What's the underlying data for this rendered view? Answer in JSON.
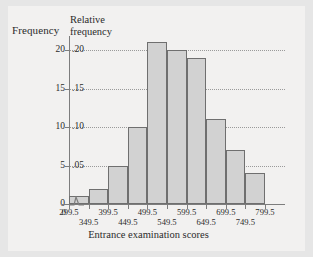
{
  "figure": {
    "background_color": "#e6e6e6",
    "plate_color": "#f2f1f0"
  },
  "chart_data": {
    "type": "bar",
    "title": "",
    "xlabel": "Entrance examination scores",
    "ylabel": "Frequency",
    "ylabel_secondary": "Relative frequency",
    "grid": true,
    "legend": "none",
    "bar_fill_color": "#d2d2d2",
    "bar_edge_color": "#6f6f6f",
    "axis_color": "#7d7d7d",
    "ylim": [
      0,
      21.8
    ],
    "xlim_labels": [
      "0",
      "299.5",
      "799.5"
    ],
    "bin_width": 50,
    "bin_edges": [
      299.5,
      349.5,
      399.5,
      449.5,
      499.5,
      549.5,
      599.5,
      649.5,
      699.5,
      749.5,
      799.5
    ],
    "categories": [
      "299.5-349.5",
      "349.5-399.5",
      "399.5-449.5",
      "449.5-499.5",
      "499.5-549.5",
      "549.5-599.5",
      "599.5-649.5",
      "649.5-699.5",
      "699.5-749.5",
      "749.5-799.5"
    ],
    "values": [
      1,
      2,
      5,
      10,
      21,
      20,
      19,
      11,
      7,
      4
    ],
    "relative_values": [
      0.01,
      0.02,
      0.05,
      0.1,
      0.21,
      0.2,
      0.19,
      0.11,
      0.07,
      0.04
    ],
    "y_ticks_frequency": [
      "0",
      "5",
      "10",
      "15",
      "20"
    ],
    "y_ticks_frequency_values": [
      0,
      5,
      10,
      15,
      20
    ],
    "y_ticks_relative": [
      ".05",
      ".10",
      ".15",
      ".20"
    ],
    "y_ticks_relative_values": [
      5,
      10,
      15,
      20
    ],
    "x_ticks_row1": [
      "0",
      "299.5",
      "399.5",
      "499.5",
      "599.5",
      "699.5",
      "799.5"
    ],
    "x_ticks_row2": [
      "349.5",
      "449.5",
      "549.5",
      "649.5",
      "749.5"
    ],
    "axis_break": true
  },
  "axes": {
    "frequency_title": "Frequency",
    "relative_frequency_title_line1": "Relative",
    "relative_frequency_title_line2": "frequency",
    "x_axis_title": "Entrance examination scores"
  },
  "y_labels_left": [
    {
      "text": "20",
      "value": 20
    },
    {
      "text": "15",
      "value": 15
    },
    {
      "text": "10",
      "value": 10
    },
    {
      "text": "5",
      "value": 5
    },
    {
      "text": "0",
      "value": 0
    }
  ],
  "y_labels_right": [
    {
      "text": ".20",
      "value": 20
    },
    {
      "text": ".15",
      "value": 15
    },
    {
      "text": ".10",
      "value": 10
    },
    {
      "text": ".05",
      "value": 5
    }
  ],
  "x_labels_row1": [
    {
      "text": "0",
      "pos": 0
    },
    {
      "text": "299.5",
      "pos": 1
    },
    {
      "text": "399.5",
      "pos": 3
    },
    {
      "text": "499.5",
      "pos": 5
    },
    {
      "text": "599.5",
      "pos": 7
    },
    {
      "text": "699.5",
      "pos": 9
    },
    {
      "text": "799.5",
      "pos": 11
    }
  ],
  "x_labels_row2": [
    {
      "text": "349.5",
      "pos": 2
    },
    {
      "text": "449.5",
      "pos": 4
    },
    {
      "text": "549.5",
      "pos": 6
    },
    {
      "text": "649.5",
      "pos": 8
    },
    {
      "text": "749.5",
      "pos": 10
    }
  ]
}
